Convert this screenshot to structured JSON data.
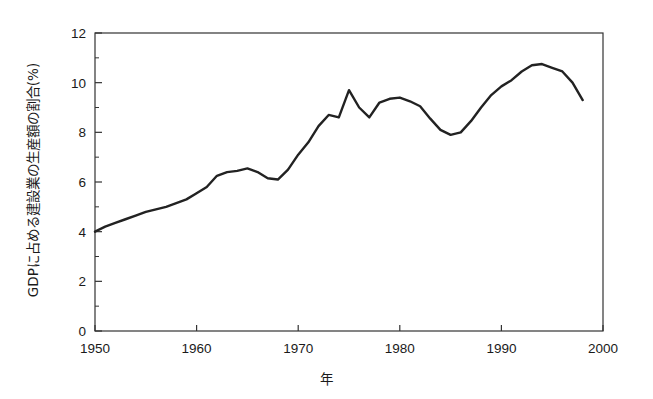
{
  "chart_data": {
    "type": "line",
    "title": "",
    "xlabel": "年",
    "ylabel": "GDPに占める建設業の生産額の割合(%)",
    "xlim": [
      1950,
      2000
    ],
    "ylim": [
      0,
      12
    ],
    "xticks": [
      1950,
      1960,
      1970,
      1980,
      1990,
      2000
    ],
    "yticks": [
      0,
      2,
      4,
      6,
      8,
      10,
      12
    ],
    "xtick_labels": [
      "1950",
      "1960",
      "1970",
      "1980",
      "1990",
      "2000"
    ],
    "ytick_labels": [
      "0",
      "2",
      "4",
      "6",
      "8",
      "10",
      "12"
    ],
    "minor_ticks": true,
    "grid": false,
    "legend": null,
    "line_color": "#222222",
    "line_width": 2.4,
    "frame": true,
    "x": [
      1950,
      1951,
      1952,
      1953,
      1954,
      1955,
      1956,
      1957,
      1958,
      1959,
      1960,
      1961,
      1962,
      1963,
      1964,
      1965,
      1966,
      1967,
      1968,
      1969,
      1970,
      1971,
      1972,
      1973,
      1974,
      1975,
      1976,
      1977,
      1978,
      1979,
      1980,
      1981,
      1982,
      1983,
      1984,
      1985,
      1986,
      1987,
      1988,
      1989,
      1990,
      1991,
      1992,
      1993,
      1994,
      1995,
      1996,
      1997,
      1998
    ],
    "values": [
      4.0,
      4.2,
      4.35,
      4.5,
      4.65,
      4.8,
      4.9,
      5.0,
      5.15,
      5.3,
      5.55,
      5.8,
      6.25,
      6.4,
      6.45,
      6.55,
      6.4,
      6.15,
      6.1,
      6.5,
      7.1,
      7.6,
      8.25,
      8.7,
      8.6,
      9.7,
      9.0,
      8.6,
      9.2,
      9.35,
      9.4,
      9.25,
      9.05,
      8.55,
      8.1,
      7.9,
      8.0,
      8.45,
      9.0,
      9.5,
      9.85,
      10.1,
      10.45,
      10.7,
      10.75,
      10.6,
      10.45,
      10.0,
      9.3
    ]
  }
}
